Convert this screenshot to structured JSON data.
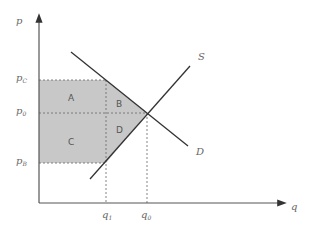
{
  "diagram": {
    "axes": {
      "y_label": "p",
      "x_label": "q"
    },
    "price_labels": [
      {
        "id": "pc",
        "main": "p",
        "sub": "C"
      },
      {
        "id": "p0",
        "main": "p",
        "sub": "0"
      },
      {
        "id": "pb",
        "main": "p",
        "sub": "B"
      }
    ],
    "quantity_labels": [
      {
        "id": "q1",
        "main": "q",
        "sub": "1"
      },
      {
        "id": "q0",
        "main": "q",
        "sub": "0"
      }
    ],
    "curves": [
      {
        "id": "supply",
        "label": "S"
      },
      {
        "id": "demand",
        "label": "D"
      }
    ],
    "regions": [
      {
        "id": "A",
        "label": "A"
      },
      {
        "id": "B",
        "label": "B"
      },
      {
        "id": "C",
        "label": "C"
      },
      {
        "id": "D",
        "label": "D"
      }
    ],
    "colors": {
      "shade": "#c8c8c8",
      "line": "#333333",
      "axis": "#555555",
      "dash": "#666666"
    }
  }
}
